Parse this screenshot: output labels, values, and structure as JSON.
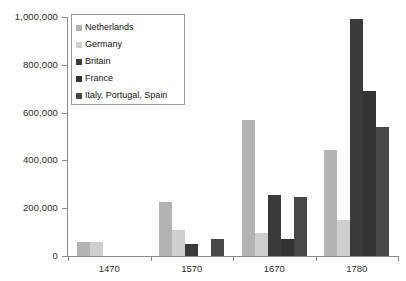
{
  "chart_data": {
    "type": "bar",
    "title": "",
    "subtitle": "",
    "xlabel": "",
    "ylabel": "",
    "categories": [
      "1470",
      "1570",
      "1670",
      "1780"
    ],
    "ylim": [
      0,
      1000000
    ],
    "ytick_values": [
      0,
      200000,
      400000,
      600000,
      800000,
      1000000
    ],
    "ytick_labels": [
      "0",
      "200,000",
      "400,000",
      "600,000",
      "800,000",
      "1,000,000"
    ],
    "grid": false,
    "legend_position": "top-left-inside",
    "series": [
      {
        "name": "Netherlands",
        "color": "#b3b3b3",
        "values": [
          60000,
          228000,
          568000,
          445000
        ]
      },
      {
        "name": "Germany",
        "color": "#cfcfcf",
        "values": [
          60000,
          110000,
          98000,
          150000
        ]
      },
      {
        "name": "Britain",
        "color": "#3a3a3a",
        "values": [
          0,
          50000,
          255000,
          990000
        ]
      },
      {
        "name": "France",
        "color": "#333333",
        "values": [
          0,
          0,
          70000,
          690000
        ]
      },
      {
        "name": "Italy, Portugal, Spain",
        "color": "#474747",
        "values": [
          0,
          72000,
          248000,
          540000
        ]
      }
    ]
  },
  "legend": {
    "entries": [
      {
        "label": "Netherlands"
      },
      {
        "label": "Germany"
      },
      {
        "label": "Britain"
      },
      {
        "label": "France"
      },
      {
        "label": "Italy, Portugal, Spain"
      }
    ]
  },
  "axes": {
    "y_labels": [
      "1,000,000",
      "800,000",
      "600,000",
      "400,000",
      "200,000",
      "0"
    ],
    "x_labels": [
      "1470",
      "1570",
      "1670",
      "1780"
    ]
  }
}
